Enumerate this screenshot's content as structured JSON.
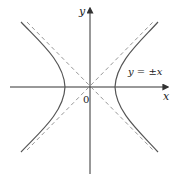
{
  "diagram": {
    "type": "hyperbola",
    "equation_shown": "x^2 - y^2 = a^2",
    "axes": {
      "x_label": "x",
      "y_label": "y",
      "origin_label": "0"
    },
    "asymptote_label": "y = ±x",
    "colors": {
      "axis": "#333333",
      "curve": "#555555",
      "asymptote": "#8a8a8a",
      "background": "#ffffff"
    }
  }
}
